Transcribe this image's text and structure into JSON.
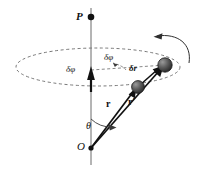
{
  "figure": {
    "background_color": "#ffffff",
    "ink_color": "#111111",
    "dash_color": "#555555",
    "sphere_color": "#4a4a4a",
    "width": 197,
    "height": 171
  },
  "labels": {
    "pole_point": "P",
    "origin": "O",
    "polar_angle": "θ",
    "delta_phi_axis": "δφ",
    "delta_phi_arc": "δφ",
    "delta_r": "δr",
    "vector_r": "r",
    "vector_r_prime": "r′"
  },
  "points": {
    "pole_dot": {
      "x": 91,
      "y": 17
    },
    "origin_dot": {
      "x": 91,
      "y": 148
    },
    "particle_initial": {
      "x": 138,
      "y": 86
    },
    "particle_final": {
      "x": 165,
      "y": 65
    },
    "ellipse_center": {
      "x": 98,
      "y": 67
    },
    "ellipse_radius_x": 82,
    "ellipse_radius_y": 19
  },
  "elements": {
    "axis_line": "vertical-rotation-axis",
    "dashed_ellipse": "circle-of-rotation",
    "delta_phi_arrow": "angular-displacement-vector",
    "rotation_arrow": "sense-of-rotation-arrow",
    "vector_r": "position-vector-before",
    "vector_r_prime": "position-vector-after",
    "delta_r_arrow": "displacement-vector"
  }
}
